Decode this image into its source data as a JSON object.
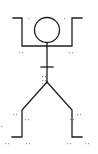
{
  "diagram": {
    "type": "stick-figure",
    "colors": {
      "line": "#1e1e1e",
      "markers": "#9a9a9a",
      "background": "#ffffff"
    },
    "head": {
      "cx": 47,
      "cy": 30,
      "r": 12.5
    },
    "arms": "M13 18 H22 V46 H72 V18 H82",
    "spine": "M47 43 V82",
    "crossbar": "M41 67 H53",
    "left_leg": "M47 82 L22 110 V137 H12",
    "right_leg": "M47 82 L72 110 V137 H82",
    "markers": [
      [
        28,
        18
      ],
      [
        64,
        18
      ],
      [
        19,
        52
      ],
      [
        22,
        52
      ],
      [
        69,
        52
      ],
      [
        72,
        52
      ],
      [
        42,
        76
      ],
      [
        45,
        76
      ],
      [
        42,
        80
      ],
      [
        45,
        80
      ],
      [
        42,
        83
      ],
      [
        46,
        83
      ],
      [
        13,
        114
      ],
      [
        16,
        114
      ],
      [
        25,
        119
      ],
      [
        28,
        119
      ],
      [
        70,
        119
      ],
      [
        73,
        119
      ],
      [
        77,
        114
      ],
      [
        80,
        114
      ],
      [
        1,
        126
      ],
      [
        5,
        143
      ],
      [
        8,
        143
      ],
      [
        26,
        143
      ],
      [
        29,
        143
      ],
      [
        67,
        143
      ],
      [
        70,
        143
      ],
      [
        85,
        143
      ],
      [
        88,
        143
      ]
    ]
  }
}
